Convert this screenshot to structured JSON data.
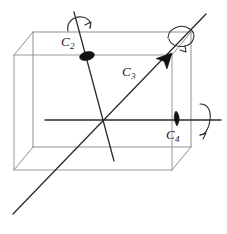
{
  "figure": {
    "background_color": "#ffffff",
    "width": 227,
    "height": 234
  },
  "colors": {
    "cube_edge": "#8a8a8a",
    "cube_edge_front": "#9a9a9a",
    "axis_line": "#2b2b2b",
    "marker_fill": "#111111",
    "label_text": "#1a1a1a",
    "arrow_stroke": "#2b2b2b"
  },
  "labels": {
    "c2": {
      "base": "C",
      "sub": "2"
    },
    "c3": {
      "base": "C",
      "sub": "3"
    },
    "c4": {
      "base": "C",
      "sub": "4"
    }
  },
  "cube": {
    "projection": "oblique",
    "front_face": {
      "left": 14,
      "right": 172,
      "top": 55,
      "bottom": 170
    },
    "depth_offset": {
      "dx": 19,
      "dy": -23
    },
    "vertices": {
      "front_top_left": [
        14,
        55
      ],
      "front_top_right": [
        172,
        55
      ],
      "front_bottom_right": [
        172,
        170
      ],
      "front_bottom_left": [
        14,
        170
      ],
      "back_top_left": [
        33,
        32
      ],
      "back_top_right": [
        191,
        32
      ],
      "back_bottom_right": [
        191,
        147
      ],
      "back_bottom_left": [
        33,
        147
      ]
    },
    "outer_silhouette": [
      [
        14,
        55
      ],
      [
        33,
        32
      ],
      [
        191,
        32
      ],
      [
        191,
        147
      ],
      [
        172,
        170
      ],
      [
        14,
        170
      ]
    ]
  },
  "axes": [
    {
      "name": "C2",
      "order": 2,
      "description": "two-fold axis through midpoints of opposite edges",
      "line": {
        "x1": 74,
        "y1": 12,
        "x2": 114,
        "y2": 161
      },
      "marker": {
        "type": "filled-ellipse",
        "cx": 87,
        "cy": 56,
        "rx": 7.5,
        "ry": 4.2,
        "rotation": -16
      },
      "label_pos": {
        "x": 63,
        "y": 45
      },
      "rotation_arrow": {
        "type": "hook",
        "cx": 78,
        "cy": 26
      }
    },
    {
      "name": "C3",
      "order": 3,
      "description": "three-fold axis along body diagonal of the cube",
      "line": {
        "x1": 13,
        "y1": 214,
        "x2": 206,
        "y2": 14
      },
      "marker": {
        "type": "solid-arrowhead",
        "cx": 169,
        "cy": 56,
        "angle": -46
      },
      "label_pos": {
        "x": 124,
        "y": 77
      },
      "rotation_arrow": {
        "type": "ellipse-loop",
        "cx": 181,
        "cy": 41
      }
    },
    {
      "name": "C4",
      "order": 4,
      "description": "four-fold axis through centers of opposite faces",
      "line": {
        "x1": 45,
        "y1": 120,
        "x2": 221,
        "y2": 120
      },
      "marker": {
        "type": "filled-teardrop",
        "cx": 176,
        "cy": 118,
        "rx": 3.2,
        "ry": 7
      },
      "label_pos": {
        "x": 168,
        "y": 139
      },
      "rotation_arrow": {
        "type": "vertical-loop",
        "cx": 203,
        "cy": 119
      }
    }
  ],
  "intersection_point": {
    "x": 100,
    "y": 120
  }
}
